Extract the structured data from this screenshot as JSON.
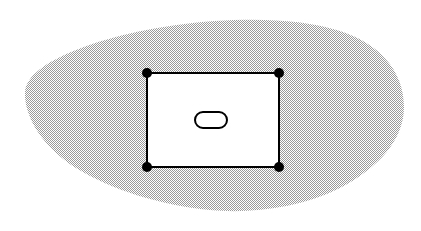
{
  "figure": {
    "canvas": {
      "width": 421,
      "height": 231,
      "background_color": "#ffffff"
    },
    "title": "",
    "caption": "",
    "elements": {
      "region_blob": {
        "name": "shaded region",
        "label": "",
        "fill_style": "halftone-checkerboard-50",
        "fill_color": "#b9b9b9",
        "stroke_color": "none",
        "path": "M 25 92 C 26 76 46 62 76 50 C 110 36 160 25 215 21 C 262 18 305 20 340 31 C 378 43 404 70 404 107 C 404 140 378 168 340 188 C 300 208 250 214 210 210 C 160 205 112 190 76 168 C 44 148 24 118 25 92 Z",
        "bounds": {
          "left": 25,
          "top": 21,
          "right": 404,
          "bottom": 212
        }
      },
      "rectangle": {
        "name": "rectangle",
        "label": "",
        "fill_color": "#ffffff",
        "stroke_color": "#000000",
        "stroke_width": 2,
        "x": 147,
        "y": 73,
        "width": 132,
        "height": 94
      },
      "corner_points": {
        "name": "corner vertices",
        "fill_color": "#000000",
        "radius": 5,
        "points": [
          {
            "label": "",
            "x": 147,
            "y": 73
          },
          {
            "label": "",
            "x": 279,
            "y": 73
          },
          {
            "label": "",
            "x": 147,
            "y": 167
          },
          {
            "label": "",
            "x": 279,
            "y": 167
          }
        ]
      },
      "inner_oval": {
        "name": "inner rounded shape",
        "label": "",
        "fill_color": "#ffffff",
        "stroke_color": "#000000",
        "stroke_width": 2,
        "cx": 211,
        "cy": 120,
        "width": 32,
        "height": 16,
        "corner_radius": 8
      }
    }
  }
}
